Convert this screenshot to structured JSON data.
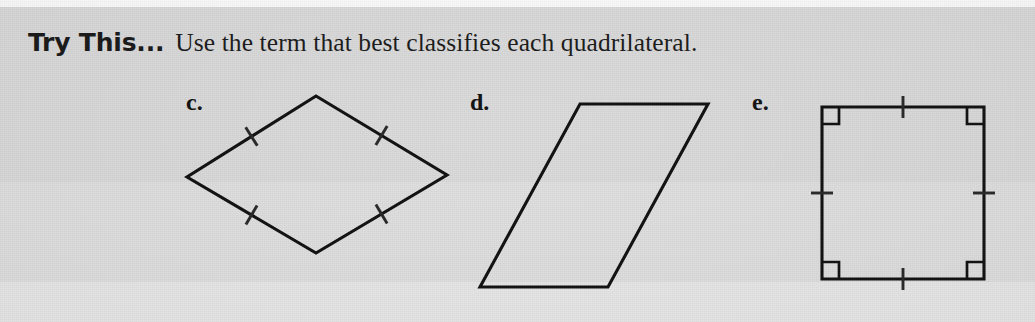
{
  "page": {
    "background_color": "#d9d9d9",
    "ink_color": "#131313"
  },
  "heading": {
    "callout_label": "Try This...",
    "instruction": "Use the term that best classifies each quadrilateral."
  },
  "figures": [
    {
      "label": "c.",
      "shape": "rhombus",
      "tick_marks_per_side": 1,
      "right_angle_marks": 0,
      "vertices": [
        {
          "x": 316,
          "y": 96
        },
        {
          "x": 447,
          "y": 175
        },
        {
          "x": 316,
          "y": 253
        },
        {
          "x": 187,
          "y": 177
        }
      ]
    },
    {
      "label": "d.",
      "shape": "parallelogram",
      "tick_marks_per_side": 0,
      "right_angle_marks": 0,
      "vertices": [
        {
          "x": 580,
          "y": 104
        },
        {
          "x": 708,
          "y": 104
        },
        {
          "x": 608,
          "y": 287
        },
        {
          "x": 480,
          "y": 287
        }
      ]
    },
    {
      "label": "e.",
      "shape": "square",
      "tick_marks_per_side": 1,
      "right_angle_marks": 4,
      "vertices": [
        {
          "x": 822,
          "y": 107
        },
        {
          "x": 984,
          "y": 107
        },
        {
          "x": 984,
          "y": 279
        },
        {
          "x": 822,
          "y": 279
        }
      ]
    }
  ]
}
